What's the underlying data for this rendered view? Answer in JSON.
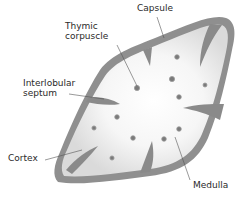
{
  "diagram": {
    "type": "anatomical-illustration",
    "colors": {
      "capsule": "#8f8f8f",
      "septum": "#8a8a8a",
      "cortex": "#d9d9d9",
      "medulla": "#f7f7f7",
      "corpuscle": "#7a7a7a",
      "leader_line": "#555555",
      "text": "#2a2a2a"
    },
    "labels": {
      "capsule": "Capsule",
      "thymic_corpuscle": "Thymic\ncorpuscle",
      "interlobular_septum": "Interlobular\nseptum",
      "cortex": "Cortex",
      "medulla": "Medulla"
    },
    "corpuscles": [
      {
        "x": 177,
        "y": 57
      },
      {
        "x": 172,
        "y": 79
      },
      {
        "x": 205,
        "y": 85
      },
      {
        "x": 137,
        "y": 88
      },
      {
        "x": 179,
        "y": 97
      },
      {
        "x": 117,
        "y": 117
      },
      {
        "x": 94,
        "y": 128
      },
      {
        "x": 179,
        "y": 129
      },
      {
        "x": 133,
        "y": 138
      },
      {
        "x": 164,
        "y": 139
      },
      {
        "x": 112,
        "y": 158
      }
    ]
  }
}
